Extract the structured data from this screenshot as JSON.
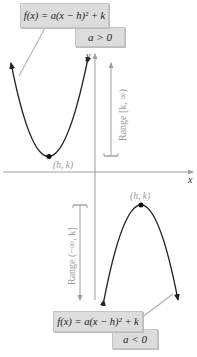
{
  "top_panel": {
    "equation": "f(x) = a(x − h)² + k",
    "condition": "a > 0",
    "vertex_label": "(h, k)",
    "range_label": "Range [k, ∞)"
  },
  "bottom_panel": {
    "equation": "f(x) = a(x − h)² + k",
    "condition": "a < 0",
    "vertex_label": "(h, k)",
    "range_label": "Range (−∞, k]"
  },
  "axes": {
    "x_label": "x",
    "y_label": "y"
  },
  "colors": {
    "curve": "#222222",
    "axis": "#9e9e9e",
    "label_box": "#dcdcdc",
    "range_text": "#9a9a9a"
  }
}
